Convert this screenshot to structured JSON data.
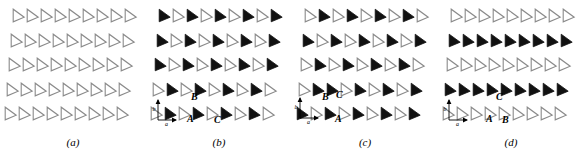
{
  "figure": {
    "type": "lattice-diagram",
    "rows": 5,
    "columns": 9,
    "colors": {
      "filled": "#111111",
      "outline_stroke": "#8a8a8a",
      "outline_fill": "#ffffff",
      "text": "#000000"
    }
  },
  "panels": [
    {
      "id": "a",
      "caption": "(a)",
      "left": 0,
      "has_axes": false,
      "point_labels": [],
      "pattern": [
        [
          0,
          0,
          0,
          0,
          0,
          0,
          0,
          0,
          0
        ],
        [
          0,
          0,
          0,
          0,
          0,
          0,
          0,
          0,
          0
        ],
        [
          0,
          0,
          0,
          0,
          0,
          0,
          0,
          0,
          0
        ],
        [
          0,
          0,
          0,
          0,
          0,
          0,
          0,
          0,
          0
        ],
        [
          0,
          0,
          0,
          0,
          0,
          0,
          0,
          0,
          0
        ]
      ]
    },
    {
      "id": "b",
      "caption": "(b)",
      "left": 146,
      "has_axes": true,
      "axes": {
        "x": 6,
        "y": 96,
        "label_a": "a",
        "label_b": "b"
      },
      "point_labels": [
        {
          "text": "A",
          "x": 41,
          "y": 114
        },
        {
          "text": "B",
          "x": 45,
          "y": 92
        },
        {
          "text": "C",
          "x": 68,
          "y": 115
        }
      ],
      "pattern": [
        [
          1,
          0,
          1,
          0,
          1,
          0,
          1,
          0,
          1
        ],
        [
          1,
          0,
          1,
          0,
          1,
          0,
          1,
          0,
          1
        ],
        [
          1,
          0,
          1,
          0,
          1,
          0,
          1,
          0,
          1
        ],
        [
          0,
          1,
          0,
          1,
          0,
          1,
          0,
          1,
          0
        ],
        [
          0,
          1,
          0,
          1,
          0,
          1,
          0,
          1,
          0
        ]
      ]
    },
    {
      "id": "c",
      "caption": "(c)",
      "left": 292,
      "has_axes": true,
      "axes": {
        "x": 2,
        "y": 94,
        "label_a": "a",
        "label_b": "b"
      },
      "point_labels": [
        {
          "text": "A",
          "x": 43,
          "y": 114
        },
        {
          "text": "B",
          "x": 30,
          "y": 92
        },
        {
          "text": "C",
          "x": 44,
          "y": 90
        }
      ],
      "pattern": [
        [
          0,
          1,
          0,
          1,
          0,
          1,
          0,
          1,
          0
        ],
        [
          1,
          0,
          1,
          0,
          1,
          0,
          1,
          0,
          1
        ],
        [
          0,
          1,
          0,
          1,
          0,
          1,
          0,
          1,
          0
        ],
        [
          0,
          1,
          1,
          0,
          1,
          0,
          1,
          0,
          1
        ],
        [
          1,
          0,
          1,
          0,
          1,
          0,
          1,
          0,
          1
        ]
      ]
    },
    {
      "id": "d",
      "caption": "(d)",
      "left": 438,
      "has_axes": true,
      "axes": {
        "x": 5,
        "y": 96,
        "label_a": "a",
        "label_b": "b"
      },
      "point_labels": [
        {
          "text": "A",
          "x": 48,
          "y": 114
        },
        {
          "text": "B",
          "x": 64,
          "y": 115
        },
        {
          "text": "C",
          "x": 58,
          "y": 92
        }
      ],
      "pattern": [
        [
          0,
          0,
          0,
          0,
          0,
          0,
          0,
          0,
          0
        ],
        [
          1,
          1,
          1,
          1,
          1,
          1,
          1,
          1,
          1
        ],
        [
          0,
          0,
          0,
          0,
          0,
          0,
          0,
          0,
          0
        ],
        [
          1,
          1,
          1,
          1,
          1,
          1,
          1,
          1,
          1
        ],
        [
          0,
          0,
          0,
          0,
          0,
          0,
          0,
          0,
          0
        ]
      ]
    }
  ],
  "layout": {
    "cell_dx": 14.0,
    "cell_dy": 24.5,
    "row_offset_x": -2.0,
    "origin_x": 12,
    "origin_y": 8
  }
}
